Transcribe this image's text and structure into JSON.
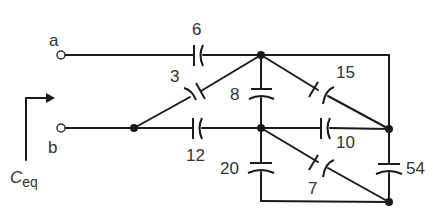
{
  "diagram": {
    "type": "capacitor-network",
    "terminals": [
      {
        "id": "a",
        "label": "a"
      },
      {
        "id": "b",
        "label": "b"
      }
    ],
    "equivalent_label": {
      "main": "C",
      "sub": "eq"
    },
    "capacitors": [
      {
        "id": "c6",
        "label": "6"
      },
      {
        "id": "c3",
        "label": "3"
      },
      {
        "id": "c12",
        "label": "12"
      },
      {
        "id": "c8",
        "label": "8"
      },
      {
        "id": "c15",
        "label": "15"
      },
      {
        "id": "c10",
        "label": "10"
      },
      {
        "id": "c20",
        "label": "20"
      },
      {
        "id": "c7",
        "label": "7"
      },
      {
        "id": "c54",
        "label": "54"
      }
    ]
  }
}
